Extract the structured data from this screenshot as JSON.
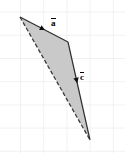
{
  "figure": {
    "type": "vector-diagram",
    "title": "",
    "background_color": "#ffffff",
    "canvas": {
      "width": 125,
      "height": 153
    },
    "grid": {
      "visible": true,
      "color": "#e3e3ec",
      "spacing_px": 23.2,
      "x_offset_px": -3.2,
      "y_offset_px": 11.6,
      "line_width": 1
    },
    "polygon": {
      "name": "shaded-quadrilateral",
      "fill_color": "#c9c9c9",
      "fill_opacity": 1,
      "stroke_color": "#3a3a3a",
      "stroke_width": 1.1,
      "points": "20,17 68,42 90,140 20,17"
    },
    "vectors": [
      {
        "id": "a",
        "label": "a",
        "has_overbar": true,
        "label_x": 51,
        "label_y": 19,
        "start": {
          "x": 20,
          "y": 17
        },
        "end": {
          "x": 68,
          "y": 42
        },
        "stroke_color": "#2e2e2e",
        "stroke_width": 1.2,
        "arrow_at_fraction": 0.52,
        "arrow_color": "#101010"
      },
      {
        "id": "c",
        "label": "c",
        "has_overbar": true,
        "label_x": 80,
        "label_y": 73,
        "start": {
          "x": 68,
          "y": 42
        },
        "end": {
          "x": 90,
          "y": 140
        },
        "stroke_color": "#2e2e2e",
        "stroke_width": 1.2,
        "arrow_at_fraction": 0.42,
        "arrow_color": "#101010"
      }
    ],
    "edges": [
      {
        "id": "closing-edge",
        "name": "dashed-hypotenuse",
        "start": {
          "x": 20,
          "y": 17
        },
        "end": {
          "x": 90,
          "y": 140
        },
        "style": "dashed",
        "dash_pattern": "4 2.2",
        "stroke_color": "#3c3c3c",
        "stroke_width": 1.3
      }
    ]
  }
}
